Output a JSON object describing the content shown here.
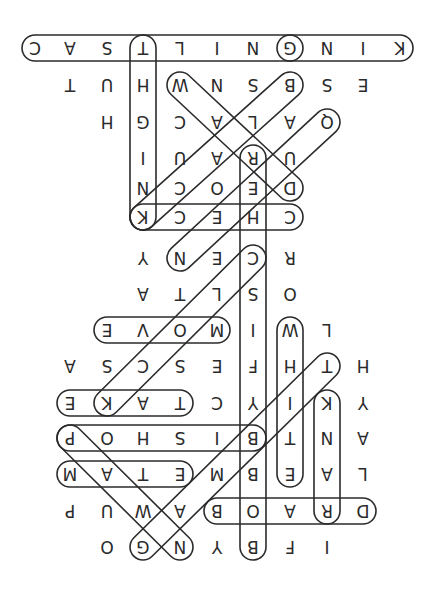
{
  "puzzle": {
    "type": "word-search",
    "orientation": "rotated-180",
    "grid_origin": {
      "x": 35,
      "y_rows": [
        48,
        85,
        122,
        158,
        188,
        217,
        258,
        294,
        330,
        366,
        403,
        438,
        474,
        511,
        547
      ]
    },
    "col_x": [
      35,
      70,
      107,
      143,
      180,
      217,
      253,
      290,
      327,
      363,
      400
    ],
    "rows": [
      [
        "C",
        "A",
        "S",
        "T",
        "L",
        "I",
        "N",
        "G",
        "N",
        "I",
        "K"
      ],
      [
        null,
        "T",
        "U",
        "H",
        "W",
        "N",
        "S",
        "B",
        "S",
        "E",
        null
      ],
      [
        null,
        null,
        "H",
        "G",
        "C",
        "A",
        "L",
        "A",
        "Q",
        null,
        null
      ],
      [
        null,
        null,
        null,
        "I",
        "U",
        "A",
        "R",
        "U",
        null,
        null,
        null
      ],
      [
        null,
        null,
        null,
        "N",
        "C",
        "O",
        "E",
        "D",
        null,
        null,
        null
      ],
      [
        null,
        null,
        null,
        "K",
        "C",
        "E",
        "H",
        "C",
        null,
        null,
        null
      ],
      [
        null,
        null,
        null,
        "Y",
        "N",
        "E",
        "C",
        "R",
        null,
        null,
        null
      ],
      [
        null,
        null,
        null,
        "A",
        "T",
        "L",
        "S",
        "O",
        null,
        null,
        null
      ],
      [
        null,
        null,
        "E",
        "V",
        "O",
        "M",
        "I",
        "W",
        "L",
        null,
        null
      ],
      [
        null,
        "A",
        "S",
        "C",
        "S",
        "E",
        "F",
        "H",
        "T",
        "H",
        null
      ],
      [
        null,
        "E",
        "K",
        "A",
        "T",
        "C",
        "Y",
        "I",
        "K",
        "Y",
        null
      ],
      [
        null,
        "P",
        "O",
        "H",
        "S",
        "I",
        "B",
        "T",
        "N",
        "A",
        null
      ],
      [
        null,
        "M",
        "A",
        "T",
        "E",
        "M",
        "B",
        "E",
        "A",
        "L",
        null
      ],
      [
        null,
        "P",
        "U",
        "W",
        "A",
        "B",
        "O",
        "A",
        "R",
        "D",
        null
      ],
      [
        null,
        null,
        "O",
        "G",
        "N",
        "Y",
        "B",
        "F",
        "I",
        null,
        null
      ]
    ],
    "found_words": [
      {
        "word": "KINGCASTLING",
        "from": [
          0,
          10
        ],
        "to": [
          0,
          0
        ]
      },
      {
        "word": "G",
        "from": [
          0,
          7
        ],
        "to": [
          0,
          7
        ]
      },
      {
        "word": "KNIGHT",
        "from": [
          5,
          3
        ],
        "to": [
          0,
          3
        ]
      },
      {
        "word": "DRAW",
        "from": [
          4,
          7
        ],
        "to": [
          1,
          4
        ]
      },
      {
        "word": "BLACK",
        "from": [
          1,
          7
        ],
        "to": [
          5,
          3
        ]
      },
      {
        "word": "QUEEN",
        "from": [
          2,
          8
        ],
        "to": [
          6,
          4
        ]
      },
      {
        "word": "CHECK",
        "from": [
          5,
          7
        ],
        "to": [
          5,
          3
        ]
      },
      {
        "word": "BOBBYFISCHER",
        "from": [
          14,
          6
        ],
        "to": [
          3,
          6
        ]
      },
      {
        "word": "CLOCK",
        "from": [
          6,
          6
        ],
        "to": [
          10,
          2
        ]
      },
      {
        "word": "MOVE",
        "from": [
          8,
          5
        ],
        "to": [
          8,
          2
        ]
      },
      {
        "word": "TAKE",
        "from": [
          10,
          4
        ],
        "to": [
          10,
          1
        ]
      },
      {
        "word": "WHITE",
        "from": [
          8,
          7
        ],
        "to": [
          12,
          7
        ]
      },
      {
        "word": "RANK",
        "from": [
          13,
          8
        ],
        "to": [
          10,
          8
        ]
      },
      {
        "word": "BISHOP",
        "from": [
          11,
          6
        ],
        "to": [
          11,
          1
        ]
      },
      {
        "word": "MATE",
        "from": [
          12,
          1
        ],
        "to": [
          12,
          4
        ]
      },
      {
        "word": "BOARD",
        "from": [
          13,
          5
        ],
        "to": [
          13,
          9
        ]
      },
      {
        "word": "PAWN",
        "from": [
          11,
          1
        ],
        "to": [
          14,
          4
        ]
      },
      {
        "word": "GAMBIT",
        "from": [
          14,
          3
        ],
        "to": [
          9,
          8
        ]
      }
    ]
  }
}
